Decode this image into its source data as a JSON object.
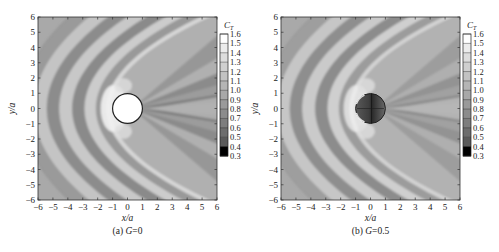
{
  "chart_data": [
    {
      "type": "heatmap",
      "subtype": "filled-contour",
      "panel_label": "(a)",
      "caption_param": "G",
      "caption_value": "0",
      "xlabel": "x/a",
      "ylabel": "y/a",
      "xlim": [
        -6,
        6
      ],
      "ylim": [
        -6,
        6
      ],
      "xticks": [
        -6,
        -5,
        -4,
        -3,
        -2,
        -1,
        0,
        1,
        2,
        3,
        4,
        5,
        6
      ],
      "yticks": [
        -6,
        -5,
        -4,
        -3,
        -2,
        -1,
        0,
        1,
        2,
        3,
        4,
        5,
        6
      ],
      "colorbar_title": "C",
      "colorbar_subscript": "T",
      "colorbar_levels": [
        1.6,
        1.5,
        1.4,
        1.3,
        1.2,
        1.1,
        1.0,
        0.9,
        0.8,
        0.7,
        0.6,
        0.5,
        0.4,
        0.3
      ],
      "cylinder": {
        "center": [
          0,
          0
        ],
        "radius": 1,
        "fill": "white"
      },
      "description": "Parabolic wave bands curving around left of cylinder; shadow wedges to the right"
    },
    {
      "type": "heatmap",
      "subtype": "filled-contour",
      "panel_label": "(b)",
      "caption_param": "G",
      "caption_value": "0.5",
      "xlabel": "x/a",
      "ylabel": "y/a",
      "xlim": [
        -6,
        6
      ],
      "ylim": [
        -6,
        6
      ],
      "xticks": [
        -6,
        -5,
        -4,
        -3,
        -2,
        -1,
        0,
        1,
        2,
        3,
        4,
        5,
        6
      ],
      "yticks": [
        -6,
        -5,
        -4,
        -3,
        -2,
        -1,
        0,
        1,
        2,
        3,
        4,
        5,
        6
      ],
      "colorbar_title": "C",
      "colorbar_subscript": "T",
      "colorbar_levels": [
        1.6,
        1.5,
        1.4,
        1.3,
        1.2,
        1.1,
        1.0,
        0.9,
        0.8,
        0.7,
        0.6,
        0.5,
        0.4,
        0.3
      ],
      "cylinder": {
        "center": [
          0,
          0
        ],
        "radius": 1,
        "fill": "dark-gradient"
      },
      "description": "Porous cylinder; wave field continues through cylinder; bands similar with reduced shadow"
    }
  ],
  "colorbar_colors": [
    "#ffffff",
    "#ececec",
    "#dddddd",
    "#cfcfcf",
    "#c2c2c2",
    "#b5b5b5",
    "#a8a8a8",
    "#9a9a9a",
    "#8c8c8c",
    "#7d7d7d",
    "#6d6d6d",
    "#5a5a5a",
    "#000000"
  ]
}
